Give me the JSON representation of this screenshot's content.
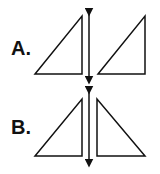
{
  "options": [
    {
      "label": "A.",
      "description": "right triangle and its translation across a vertical line (same orientation)"
    },
    {
      "label": "B.",
      "description": "right triangle and its reflection across a vertical line (mirror image)"
    }
  ],
  "colors": {
    "stroke": "#111111",
    "background": "#ffffff"
  }
}
